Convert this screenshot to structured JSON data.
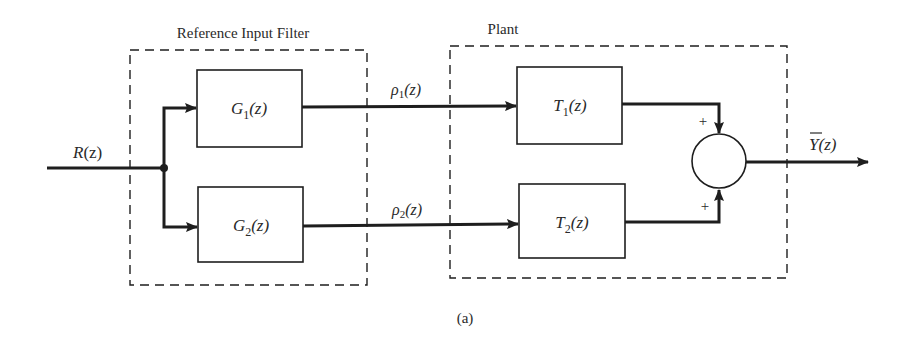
{
  "diagram": {
    "type": "block-diagram",
    "caption": "(a)",
    "groups": {
      "filter": {
        "title": "Reference Input Filter"
      },
      "plant": {
        "title": "Plant"
      }
    },
    "signals": {
      "input": {
        "name": "R",
        "arg": "(z)"
      },
      "rho1": {
        "name": "ρ",
        "sub": "1",
        "arg": "(z)"
      },
      "rho2": {
        "name": "ρ",
        "sub": "2",
        "arg": "(z)"
      },
      "output": {
        "name": "Y",
        "arg": "(z)",
        "overbar": true
      }
    },
    "blocks": {
      "g1": {
        "name": "G",
        "sub": "1",
        "arg": "(z)"
      },
      "g2": {
        "name": "G",
        "sub": "2",
        "arg": "(z)"
      },
      "t1": {
        "name": "T",
        "sub": "1",
        "arg": "(z)"
      },
      "t2": {
        "name": "T",
        "sub": "2",
        "arg": "(z)"
      }
    },
    "summing_junction": {
      "top_sign": "+",
      "bottom_sign": "+"
    },
    "colors": {
      "stroke": "#1e1e1e",
      "background": "#ffffff"
    }
  }
}
